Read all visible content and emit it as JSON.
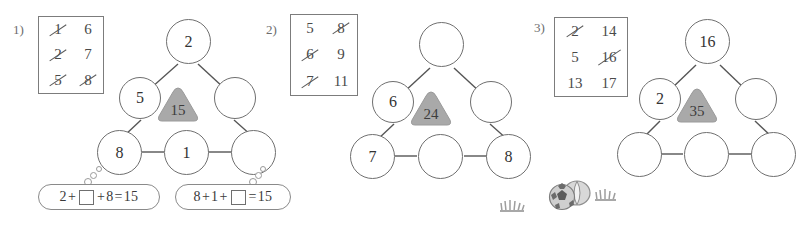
{
  "page": {
    "background": "#ffffff",
    "ink": "#4a4a4a",
    "badge_fill": "#a9a9a9",
    "badge_stroke": "#8e8e8e"
  },
  "panels": [
    {
      "index_label": "1)",
      "numbox": {
        "columns": [
          [
            {
              "value": "1",
              "struck": true
            },
            {
              "value": "2",
              "struck": true
            },
            {
              "value": "5",
              "struck": true
            }
          ],
          [
            {
              "value": "6",
              "struck": false
            },
            {
              "value": "7",
              "struck": false
            },
            {
              "value": "8",
              "struck": true
            }
          ]
        ]
      },
      "triangle": {
        "badge": "15",
        "nodes": {
          "top": "2",
          "left_mid": "5",
          "right_mid": "",
          "bottom_left": "8",
          "bottom_mid": "1",
          "bottom_right": ""
        }
      },
      "bubbles": [
        {
          "parts": [
            "2",
            "+",
            "box",
            "+",
            "8",
            "=",
            "15"
          ],
          "text": "2+□+8=15"
        },
        {
          "parts": [
            "8",
            "+",
            "1",
            "+",
            "box",
            "=",
            "15"
          ],
          "text": "8+1+□=15"
        }
      ]
    },
    {
      "index_label": "2)",
      "numbox": {
        "columns": [
          [
            {
              "value": "5",
              "struck": false
            },
            {
              "value": "6",
              "struck": true
            },
            {
              "value": "7",
              "struck": true
            }
          ],
          [
            {
              "value": "8",
              "struck": true
            },
            {
              "value": "9",
              "struck": false
            },
            {
              "value": "11",
              "struck": false
            }
          ]
        ]
      },
      "triangle": {
        "badge": "24",
        "nodes": {
          "top": "",
          "left_mid": "6",
          "right_mid": "",
          "bottom_left": "7",
          "bottom_mid": "",
          "bottom_right": "8"
        }
      },
      "bubbles": []
    },
    {
      "index_label": "3)",
      "numbox": {
        "columns": [
          [
            {
              "value": "2",
              "struck": true
            },
            {
              "value": "5",
              "struck": false
            },
            {
              "value": "13",
              "struck": false
            }
          ],
          [
            {
              "value": "14",
              "struck": false
            },
            {
              "value": "16",
              "struck": true
            },
            {
              "value": "17",
              "struck": false
            }
          ]
        ]
      },
      "triangle": {
        "badge": "35",
        "nodes": {
          "top": "16",
          "left_mid": "2",
          "right_mid": "",
          "bottom_left": "",
          "bottom_mid": "",
          "bottom_right": ""
        }
      },
      "bubbles": []
    }
  ],
  "decorations": [
    {
      "name": "grass-tuft-left",
      "x": 498,
      "y": 196
    },
    {
      "name": "sports-balls",
      "x": 548,
      "y": 180
    },
    {
      "name": "grass-tuft-right",
      "x": 593,
      "y": 188
    }
  ]
}
